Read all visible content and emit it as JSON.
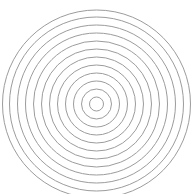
{
  "figure": {
    "type": "concentric-circles",
    "background": "#ffffff",
    "stroke_color": "#9c9c9c",
    "stroke_width": 1,
    "center": [
      96.5,
      104
    ],
    "radii": [
      7,
      15,
      23,
      31,
      39,
      47,
      55,
      63,
      71,
      79,
      87,
      94
    ]
  }
}
